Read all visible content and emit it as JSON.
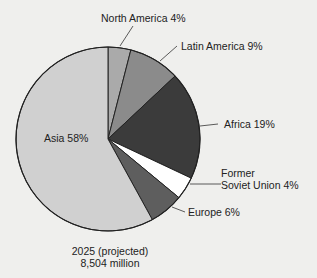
{
  "chart_data": {
    "type": "pie",
    "title": "",
    "caption_line1": "2025 (projected)",
    "caption_line2": "8,504 million",
    "start_angle": "12 o'clock",
    "direction": "clockwise",
    "slices": [
      {
        "name": "North America",
        "value": 4,
        "label": "North America 4%",
        "color": "#aaaaaa"
      },
      {
        "name": "Latin America",
        "value": 9,
        "label": "Latin America 9%",
        "color": "#8b8b8b"
      },
      {
        "name": "Africa",
        "value": 19,
        "label": "Africa 19%",
        "color": "#3b3b3b"
      },
      {
        "name": "Former Soviet Union",
        "value": 4,
        "label_line1": "Former",
        "label_line2": "Soviet Union 4%",
        "color": "#ffffff"
      },
      {
        "name": "Europe",
        "value": 6,
        "label": "Europe 6%",
        "color": "#5e5e5e"
      },
      {
        "name": "Asia",
        "value": 58,
        "label": "Asia 58%",
        "color": "#d0d0d0"
      }
    ],
    "total_label": "8,504 million",
    "legend": "none (direct labels)"
  }
}
